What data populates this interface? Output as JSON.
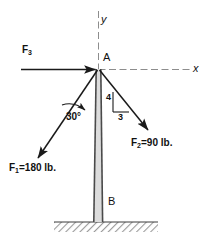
{
  "figure": {
    "axes": {
      "x_label": "x",
      "y_label": "y"
    },
    "points": {
      "joint_label": "A",
      "base_label": "B"
    },
    "forces": [
      {
        "id": "F1",
        "symbol": "F",
        "subscript": "1",
        "text": "F1=180 lb.",
        "magnitude": "180",
        "unit": "lb.",
        "direction": "down-left",
        "angle_from_post": "30"
      },
      {
        "id": "F2",
        "symbol": "F",
        "subscript": "2",
        "text": "F2=90 lb.",
        "magnitude": "90",
        "unit": "lb.",
        "direction": "down-right",
        "slope_rise": "4",
        "slope_run": "3"
      },
      {
        "id": "F3",
        "symbol": "F",
        "subscript": "3",
        "text": "F3",
        "magnitude": "",
        "unit": "",
        "direction": "right-horizontal"
      }
    ],
    "annotations": {
      "angle_label": "30°",
      "slope_rise_label": "4",
      "slope_run_label": "3"
    },
    "colors": {
      "line": "#1a1a1a",
      "axis": "#8a8a8a",
      "post_fill": "#d8d8d8",
      "post_edge": "#4a4a4a",
      "ground": "#b9b9b9",
      "background": "#ffffff"
    }
  }
}
